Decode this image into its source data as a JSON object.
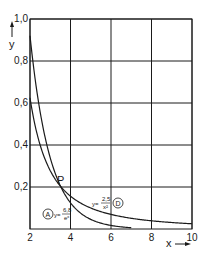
{
  "chart_data": {
    "type": "line",
    "title": "",
    "xlabel": "x",
    "ylabel": "y",
    "xlim": [
      2,
      10
    ],
    "ylim": [
      0,
      1.0
    ],
    "grid": true,
    "x_ticks": [
      "2",
      "4",
      "6",
      "8",
      "10"
    ],
    "y_ticks": [
      "0,2",
      "0,4",
      "0,6",
      "0,8",
      "1,0"
    ],
    "series": [
      {
        "name": "A",
        "formula": "y = 6.8 / e^x",
        "label_marker": "A",
        "label_formula_num": "6,8",
        "label_formula_den": "e^x",
        "x": [
          2,
          2.5,
          3,
          3.5,
          4,
          5,
          6,
          7,
          8
        ],
        "values": [
          0.92,
          0.56,
          0.34,
          0.21,
          0.125,
          0.046,
          0.017,
          0.006,
          0.002
        ]
      },
      {
        "name": "D",
        "formula": "y = 2.5 / x^2",
        "label_marker": "D",
        "label_formula_num": "2,5",
        "label_formula_den": "x²",
        "x": [
          2,
          2.5,
          3,
          3.5,
          4,
          5,
          6,
          7,
          8,
          9,
          10
        ],
        "values": [
          0.625,
          0.4,
          0.278,
          0.204,
          0.156,
          0.1,
          0.069,
          0.051,
          0.039,
          0.031,
          0.025
        ]
      }
    ],
    "annotations": [
      {
        "text": "P",
        "x": 3.4,
        "y": 0.22,
        "description": "intersection point of curves A and D"
      }
    ]
  },
  "labels": {
    "y_axis": "y",
    "x_axis": "x",
    "point": "P",
    "eq_prefix": "y=",
    "marker_a": "A",
    "marker_d": "D",
    "a_num": "6,8",
    "a_den": "eˣ",
    "d_num": "2,5",
    "d_den": "x²"
  }
}
